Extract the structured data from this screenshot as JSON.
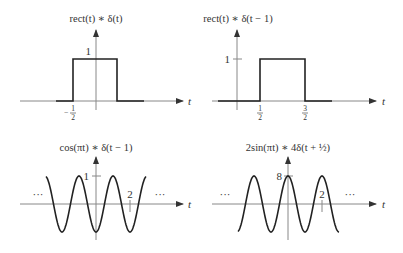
{
  "panels": [
    {
      "id": "rect-conv-delta",
      "title": "rect(t) ∗ δ(t)",
      "axis_label": "t",
      "y_tick_label": "1",
      "x_tick_labels": [
        {
          "num": "1",
          "den": "2",
          "sign": "−"
        }
      ],
      "signal": "rect(t)"
    },
    {
      "id": "rect-conv-shifted-delta",
      "title": "rect(t) ∗ δ(t − 1)",
      "axis_label": "t",
      "y_tick_label": "1",
      "x_tick_labels": [
        {
          "num": "1",
          "den": "2",
          "sign": ""
        },
        {
          "num": "3",
          "den": "2",
          "sign": ""
        }
      ],
      "signal": "rect(t − 1)"
    },
    {
      "id": "cos-conv-shifted-delta",
      "title": "cos(πt) ∗ δ(t − 1)",
      "axis_label": "t",
      "y_tick_label": "1",
      "x_tick_label": "2",
      "ellipsis": "···",
      "signal": "cos(π(t − 1))"
    },
    {
      "id": "sin-conv-scaled-delta",
      "title": "2sin(πt) ∗ 4δ(t + ½)",
      "axis_label": "t",
      "y_tick_label": "8",
      "x_tick_label": "2",
      "ellipsis": "···",
      "signal": "8cos(πt)"
    }
  ],
  "colors": {
    "curve": "#222222",
    "axis": "#777777",
    "text": "#333333"
  }
}
